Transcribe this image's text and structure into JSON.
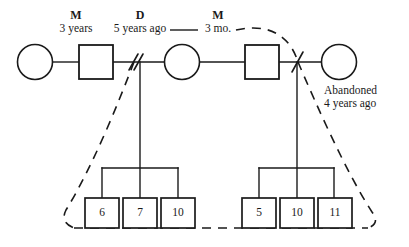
{
  "diagram": {
    "type": "genogram",
    "background_color": "#ffffff",
    "line_color": "#1a1a1a",
    "relationship_labels": [
      {
        "id": "union-1",
        "code": "M",
        "detail": "3 years"
      },
      {
        "id": "union-1-end",
        "code": "D",
        "detail": "5 years ago"
      },
      {
        "id": "union-2",
        "code": "M",
        "detail": "3 mo."
      }
    ],
    "annotations": [
      {
        "id": "abandonment-note",
        "line1": "Abandoned",
        "line2": "4 years ago"
      }
    ],
    "persons": [
      {
        "id": "p1",
        "shape": "circle",
        "sex": "female",
        "label": ""
      },
      {
        "id": "p2",
        "shape": "square",
        "sex": "male",
        "label": ""
      },
      {
        "id": "p3",
        "shape": "circle",
        "sex": "female",
        "label": ""
      },
      {
        "id": "p4",
        "shape": "square",
        "sex": "male",
        "label": ""
      },
      {
        "id": "p5",
        "shape": "circle",
        "sex": "female",
        "label": ""
      }
    ],
    "sibling_groups": [
      {
        "id": "sibship-left",
        "children": [
          {
            "id": "c1",
            "shape": "square",
            "age": "6"
          },
          {
            "id": "c2",
            "shape": "square",
            "age": "7"
          },
          {
            "id": "c3",
            "shape": "square",
            "age": "10"
          }
        ]
      },
      {
        "id": "sibship-right",
        "children": [
          {
            "id": "c4",
            "shape": "square",
            "age": "5"
          },
          {
            "id": "c5",
            "shape": "square",
            "age": "10"
          },
          {
            "id": "c6",
            "shape": "square",
            "age": "11"
          }
        ]
      }
    ],
    "markers": [
      {
        "id": "divorce-marker",
        "kind": "double-slash"
      },
      {
        "id": "separation-marker",
        "kind": "single-slash"
      }
    ],
    "household_boundary": {
      "id": "household-dashed-enclosure",
      "style": "dashed"
    }
  }
}
